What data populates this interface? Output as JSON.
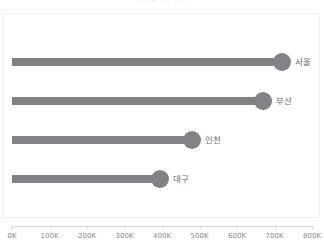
{
  "chart_data": {
    "type": "bar",
    "title": "지역별 인구 비교",
    "subtitle": "",
    "xlabel": "",
    "ylabel": "",
    "categories": [
      "서울",
      "부산",
      "인천",
      "대구"
    ],
    "values": [
      720000,
      670000,
      480000,
      395000
    ],
    "value_labels": [
      "720K",
      "670K",
      "480K",
      "395K"
    ],
    "xlim": [
      0,
      800000
    ],
    "x_ticks": [
      0,
      100000,
      200000,
      300000,
      400000,
      500000,
      600000,
      700000,
      800000
    ],
    "x_tick_labels": [
      "0K",
      "100K",
      "200K",
      "300K",
      "400K",
      "500K",
      "600K",
      "700K",
      "800K"
    ],
    "grid": false,
    "legend": false,
    "legend_position": "none",
    "orientation": "horizontal",
    "marker": "circle",
    "series": [
      {
        "name": "인구",
        "values": [
          720000,
          670000,
          480000,
          395000
        ]
      }
    ]
  },
  "colors": {
    "bar": "#808285",
    "dot": "#808285",
    "axis": "#d8d8d8",
    "tick_label": "#8a8a8a",
    "category_label": "#6b6b6b",
    "panel_border": "#f0f0f0",
    "background": "#ffffff",
    "title": "#f2f2f2"
  },
  "labels": {
    "panel_name": "plot-panel",
    "axis_name": "x-axis"
  }
}
